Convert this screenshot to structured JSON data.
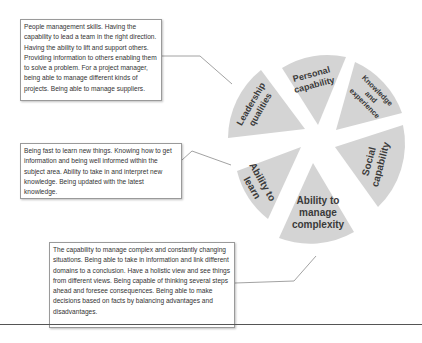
{
  "diagram": {
    "wedges": [
      {
        "id": "leadership",
        "lines": [
          "Leadership",
          "qualities"
        ]
      },
      {
        "id": "personal",
        "lines": [
          "Personal",
          "capability"
        ]
      },
      {
        "id": "knowledge",
        "lines": [
          "Knowledge",
          "and",
          "experience"
        ]
      },
      {
        "id": "social",
        "lines": [
          "Social",
          "capability"
        ]
      },
      {
        "id": "complexity",
        "lines": [
          "Ability to",
          "manage",
          "complexity"
        ]
      },
      {
        "id": "learn",
        "lines": [
          "Ability to",
          "learn"
        ]
      }
    ],
    "descriptions": {
      "leadership": "People management skills. Having the capability to lead a team in the right direction. Having the ability to lift and support others. Providing information to others enabling them to solve a problem. For a project manager, being able to manage different kinds of projects. Being able to manage suppliers.",
      "learn": "Being fast to learn new things. Knowing how to get information and being well informed within the subject area. Ability to take in and interpret new knowledge. Being updated with the latest knowledge.",
      "complexity": "The capability to manage complex and constantly changing situations. Being able to take in information and link different domains to a conclusion. Have a holistic view and see things from different views. Being capable of thinking several steps ahead and foresee consequences. Being able to make decisions based on facts by balancing advantages and disadvantages."
    },
    "colors": {
      "wedge_fill": "#d4d4d4",
      "label_text": "#3a3a3a",
      "connector": "#8a8a8a"
    }
  }
}
